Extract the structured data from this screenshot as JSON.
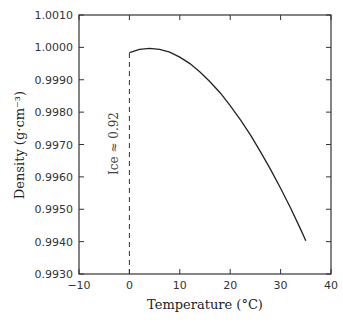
{
  "chart_data": {
    "type": "line",
    "title": "",
    "xlabel": "Temperature (°C)",
    "ylabel": "Density (g·cm⁻³)",
    "xlim": [
      -10,
      40
    ],
    "ylim": [
      0.993,
      1.001
    ],
    "xticks": [
      "−10",
      "0",
      "10",
      "20",
      "30",
      "40"
    ],
    "yticks": [
      "0.9930",
      "0.9940",
      "0.9950",
      "0.9960",
      "0.9970",
      "0.9980",
      "0.9990",
      "1.0000",
      "1.0010"
    ],
    "grid": false,
    "annotation": "Ice ≈ 0.92",
    "series": [
      {
        "name": "Water density",
        "x": [
          0,
          2,
          4,
          6,
          8,
          10,
          12,
          14,
          16,
          18,
          20,
          22,
          24,
          26,
          28,
          30,
          32,
          34,
          35
        ],
        "values": [
          0.99984,
          0.99994,
          0.99997,
          0.99994,
          0.99985,
          0.9997,
          0.9995,
          0.99924,
          0.99894,
          0.9986,
          0.9982,
          0.99777,
          0.9973,
          0.99678,
          0.99623,
          0.99565,
          0.99503,
          0.99437,
          0.99403
        ]
      },
      {
        "name": "Ice boundary (dashed)",
        "x": [
          0,
          0
        ],
        "values": [
          0.993,
          0.99984
        ]
      }
    ]
  }
}
